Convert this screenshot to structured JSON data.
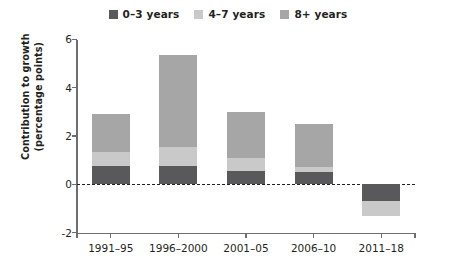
{
  "legend": {
    "items": [
      {
        "label": "0–3 years",
        "color": "#59595b",
        "icon": "legend-swatch-0-3"
      },
      {
        "label": "4–7 years",
        "color": "#c9c9c9",
        "icon": "legend-swatch-4-7"
      },
      {
        "label": "8+ years",
        "color": "#a6a6a6",
        "icon": "legend-swatch-8plus"
      }
    ]
  },
  "axes": {
    "ylabel_line1": "Contribution to growth",
    "ylabel_line2": "(percentage points)",
    "yticks": [
      "6",
      "4",
      "2",
      "0",
      "-2"
    ],
    "xticks": [
      "1991–95",
      "1996–2000",
      "2001–05",
      "2006–10",
      "2011–18"
    ]
  },
  "chart_data": {
    "type": "bar",
    "subtype": "stacked-bar",
    "title": "",
    "xlabel": "",
    "ylabel": "Contribution to growth (percentage points)",
    "ylim": [
      -2,
      6
    ],
    "yticks": [
      -2,
      0,
      2,
      4,
      6
    ],
    "grid": false,
    "legend_position": "top-center",
    "zero_reference_line": true,
    "categories": [
      "1991–95",
      "1996–2000",
      "2001–05",
      "2006–10",
      "2011–18"
    ],
    "series": [
      {
        "name": "0–3 years",
        "color": "#59595b",
        "values": [
          0.75,
          0.75,
          0.55,
          0.5,
          -0.7
        ]
      },
      {
        "name": "4–7 years",
        "color": "#c9c9c9",
        "values": [
          0.6,
          0.8,
          0.55,
          0.2,
          -0.6
        ]
      },
      {
        "name": "8+ years",
        "color": "#a6a6a6",
        "values": [
          1.55,
          3.8,
          1.9,
          1.8,
          0.0
        ]
      }
    ],
    "totals": [
      2.9,
      5.35,
      3.0,
      2.5,
      -1.3
    ]
  }
}
